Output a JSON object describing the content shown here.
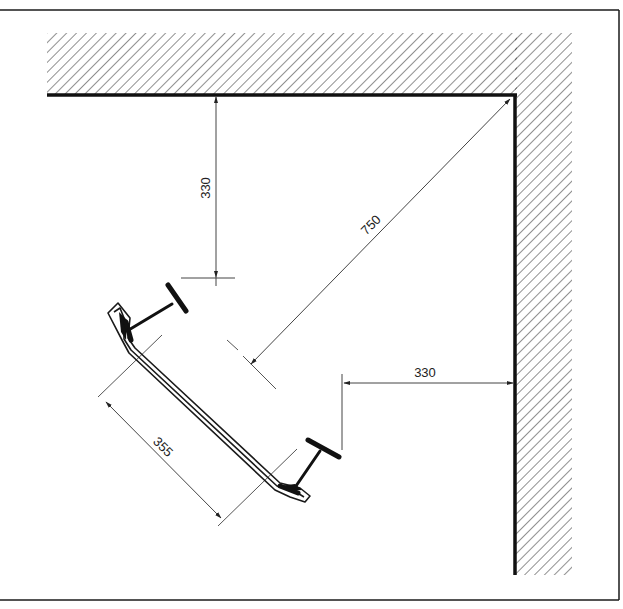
{
  "drawing": {
    "type": "corner-panel-plan",
    "colors": {
      "line": "#1a1a1a",
      "hatch": "#333333",
      "background": "#ffffff",
      "dim_line": "#444444"
    },
    "dimensions": {
      "top_wall_offset": "330",
      "corner_diagonal": "750",
      "side_wall_offset": "330",
      "panel_width": "355"
    },
    "elements": {
      "top_wall": "hatched wall (top)",
      "right_wall": "hatched wall (right)",
      "panel": "angled panel with folded edges",
      "beam_left": "I-section bracket (upper left)",
      "beam_right": "I-section bracket (lower right)"
    }
  }
}
